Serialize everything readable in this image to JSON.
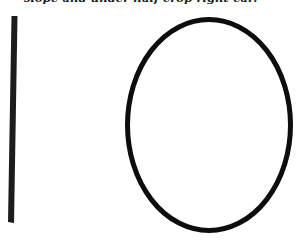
{
  "caption": {
    "text": "slope and under half crop right ear."
  },
  "figure": {
    "bar": {
      "x1": 14.5,
      "y1": 16,
      "x2": 11,
      "y2": 222,
      "width": 6,
      "color": "#1c1c1c"
    },
    "ellipse": {
      "cx": 209,
      "cy": 125,
      "rx": 82,
      "ry": 106,
      "stroke_width": 5,
      "color": "#0d0d0d"
    }
  }
}
